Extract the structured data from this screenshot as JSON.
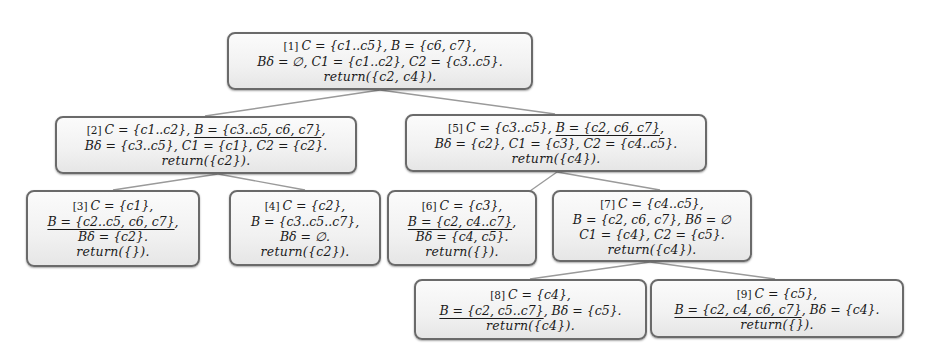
{
  "diagram": {
    "type": "search-tree",
    "nodes": [
      {
        "id": "1",
        "index": "[1]",
        "lines": [
          {
            "parts": [
              {
                "t": "C = {c1..c5}, B = {c6, c7},",
                "u": false
              }
            ]
          },
          {
            "parts": [
              {
                "t": "Bδ = ∅, C1 = {c1..c2}, C2 = {c3..c5}.",
                "u": false
              }
            ]
          },
          {
            "parts": [
              {
                "t": "return({c2, c4}).",
                "u": false
              }
            ]
          }
        ]
      },
      {
        "id": "2",
        "index": "[2]",
        "lines": [
          {
            "parts": [
              {
                "t": "C = {c1..c2}, ",
                "u": false
              },
              {
                "t": "B = {c3..c5, c6, c7}",
                "u": true
              },
              {
                "t": ",",
                "u": false
              }
            ]
          },
          {
            "parts": [
              {
                "t": "Bδ = {c3..c5}, C1 = {c1}, C2 = {c2}.",
                "u": false
              }
            ]
          },
          {
            "parts": [
              {
                "t": "return({c2}).",
                "u": false
              }
            ]
          }
        ]
      },
      {
        "id": "3",
        "index": "[3]",
        "lines": [
          {
            "parts": [
              {
                "t": "C = {c1},",
                "u": false
              }
            ]
          },
          {
            "parts": [
              {
                "t": "B = {c2..c5, c6, c7}",
                "u": true
              },
              {
                "t": ",",
                "u": false
              }
            ]
          },
          {
            "parts": [
              {
                "t": "Bδ = {c2}.",
                "u": false
              }
            ]
          },
          {
            "parts": [
              {
                "t": "return({}).",
                "u": false
              }
            ]
          }
        ]
      },
      {
        "id": "4",
        "index": "[4]",
        "lines": [
          {
            "parts": [
              {
                "t": "C = {c2},",
                "u": false
              }
            ]
          },
          {
            "parts": [
              {
                "t": "B = {c3..c5..c7},",
                "u": false
              }
            ]
          },
          {
            "parts": [
              {
                "t": "Bδ = ∅.",
                "u": false
              }
            ]
          },
          {
            "parts": [
              {
                "t": "return({c2}).",
                "u": false
              }
            ]
          }
        ]
      },
      {
        "id": "5",
        "index": "[5]",
        "lines": [
          {
            "parts": [
              {
                "t": "C = {c3..c5}, ",
                "u": false
              },
              {
                "t": "B = {c2, c6, c7}",
                "u": true
              },
              {
                "t": ",",
                "u": false
              }
            ]
          },
          {
            "parts": [
              {
                "t": "Bδ = {c2}, C1 = {c3}, C2 = {c4..c5}.",
                "u": false
              }
            ]
          },
          {
            "parts": [
              {
                "t": "return({c4}).",
                "u": false
              }
            ]
          }
        ]
      },
      {
        "id": "6",
        "index": "[6]",
        "lines": [
          {
            "parts": [
              {
                "t": "C = {c3},",
                "u": false
              }
            ]
          },
          {
            "parts": [
              {
                "t": "B = {c2, c4..c7}",
                "u": true
              },
              {
                "t": ",",
                "u": false
              }
            ]
          },
          {
            "parts": [
              {
                "t": "Bδ = {c4, c5}.",
                "u": false
              }
            ]
          },
          {
            "parts": [
              {
                "t": "return({}).",
                "u": false
              }
            ]
          }
        ]
      },
      {
        "id": "7",
        "index": "[7]",
        "lines": [
          {
            "parts": [
              {
                "t": "C = {c4..c5},",
                "u": false
              }
            ]
          },
          {
            "parts": [
              {
                "t": "B = {c2, c6, c7}, Bδ = ∅",
                "u": false
              }
            ]
          },
          {
            "parts": [
              {
                "t": "C1 = {c4}, C2 = {c5}.",
                "u": false
              }
            ]
          },
          {
            "parts": [
              {
                "t": "return({c4}).",
                "u": false
              }
            ]
          }
        ]
      },
      {
        "id": "8",
        "index": "[8]",
        "lines": [
          {
            "parts": [
              {
                "t": "C = {c4},",
                "u": false
              }
            ]
          },
          {
            "parts": [
              {
                "t": "B = {c2, c5..c7}",
                "u": true
              },
              {
                "t": ", Bδ = {c5}.",
                "u": false
              }
            ]
          },
          {
            "parts": [
              {
                "t": "return({c4}).",
                "u": false
              }
            ]
          }
        ]
      },
      {
        "id": "9",
        "index": "[9]",
        "lines": [
          {
            "parts": [
              {
                "t": "C = {c5},",
                "u": false
              }
            ]
          },
          {
            "parts": [
              {
                "t": "B = {c2, c4, c6, c7}",
                "u": true
              },
              {
                "t": ", Bδ = {c4}.",
                "u": false
              }
            ]
          },
          {
            "parts": [
              {
                "t": "return({}).",
                "u": false
              }
            ]
          }
        ]
      }
    ],
    "edges": [
      {
        "from": "1",
        "to": "2"
      },
      {
        "from": "1",
        "to": "5"
      },
      {
        "from": "2",
        "to": "3"
      },
      {
        "from": "2",
        "to": "4"
      },
      {
        "from": "5",
        "to": "6"
      },
      {
        "from": "5",
        "to": "7"
      },
      {
        "from": "7",
        "to": "8"
      },
      {
        "from": "7",
        "to": "9"
      }
    ],
    "colors": {
      "border": "#6a6a6a",
      "edge": "#9a9a9a",
      "fill": "#f1f1f1",
      "text": "#1a1a1a"
    }
  }
}
